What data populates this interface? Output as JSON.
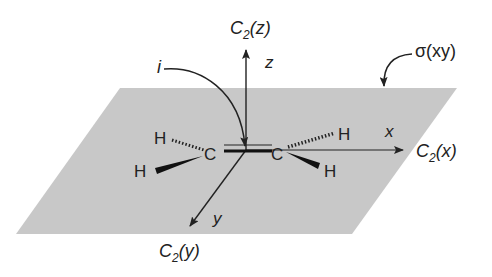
{
  "diagram": {
    "plane_color": "#c8c8c8",
    "labels": {
      "c2z": "C",
      "c2z_sub": "2",
      "c2z_arg": "(z)",
      "z": "z",
      "i": "i",
      "sigma": "σ(xy)",
      "x": "x",
      "c2x": "C",
      "c2x_sub": "2",
      "c2x_arg": "(x)",
      "y": "y",
      "c2y": "C",
      "c2y_sub": "2",
      "c2y_arg": "(y)"
    },
    "atoms": {
      "c_left": "C",
      "c_right": "C",
      "h_top_left": "H",
      "h_bottom_left": "H",
      "h_top_right": "H",
      "h_bottom_right": "H"
    }
  }
}
